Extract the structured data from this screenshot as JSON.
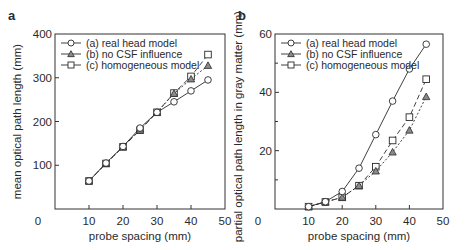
{
  "chart_data": [
    {
      "panel_label": "a",
      "type": "line",
      "title": "",
      "xlabel": "probe spacing (mm)",
      "ylabel": "mean optical path length (mm)",
      "xlim": [
        0,
        50
      ],
      "ylim": [
        0,
        400
      ],
      "xticks": [
        0,
        10,
        20,
        30,
        40,
        50
      ],
      "yticks": [
        0,
        100,
        200,
        300,
        400
      ],
      "grid": false,
      "legend_position": "upper left",
      "x": [
        10,
        15,
        20,
        25,
        30,
        35,
        40,
        45
      ],
      "series": [
        {
          "name": "(a) real head model",
          "marker": "circle",
          "line": "solid",
          "values": [
            64,
            105,
            143,
            185,
            221,
            245,
            270,
            295
          ]
        },
        {
          "name": "(b) no CSF influence",
          "marker": "triangle-filled",
          "line": "dotted",
          "values": [
            64,
            104,
            142,
            182,
            221,
            264,
            297,
            328
          ]
        },
        {
          "name": "(c) homogeneous model",
          "marker": "square",
          "line": "dashed",
          "values": [
            64,
            104,
            142,
            180,
            221,
            265,
            303,
            353
          ]
        }
      ]
    },
    {
      "panel_label": "b",
      "type": "line",
      "title": "",
      "xlabel": "probe spacing (mm)",
      "ylabel": "partial optical path length in gray matter (mm)",
      "xlim": [
        0,
        50
      ],
      "ylim": [
        0,
        60
      ],
      "xticks": [
        0,
        10,
        20,
        30,
        40,
        50
      ],
      "yticks": [
        0,
        20,
        40,
        60
      ],
      "yminor": [
        10,
        30,
        50
      ],
      "grid": false,
      "legend_position": "upper left",
      "x": [
        10,
        15,
        20,
        25,
        30,
        35,
        40,
        45
      ],
      "series": [
        {
          "name": "(a) real head model",
          "marker": "circle",
          "line": "solid",
          "values": [
            0.8,
            2.5,
            6,
            14,
            25.5,
            37,
            48,
            56.5
          ]
        },
        {
          "name": "(b) no CSF influence",
          "marker": "triangle-filled",
          "line": "dotted",
          "values": [
            0.8,
            2.4,
            4,
            8,
            13,
            19.5,
            27,
            38.5
          ]
        },
        {
          "name": "(c) homogeneous model",
          "marker": "square",
          "line": "dashed",
          "values": [
            0.8,
            2.4,
            4,
            8,
            14.5,
            23.5,
            31.5,
            44.5
          ]
        }
      ]
    }
  ],
  "layout": {
    "panels": [
      {
        "left": 55,
        "right": 225,
        "top": 34,
        "bottom": 209
      },
      {
        "left": 275,
        "right": 443,
        "top": 34,
        "bottom": 209
      }
    ]
  },
  "colors": {
    "axis": "#333333",
    "line": "#2a2a2a",
    "triangle_fill": "#8a8a8a",
    "marker_fill": "#ffffff"
  }
}
